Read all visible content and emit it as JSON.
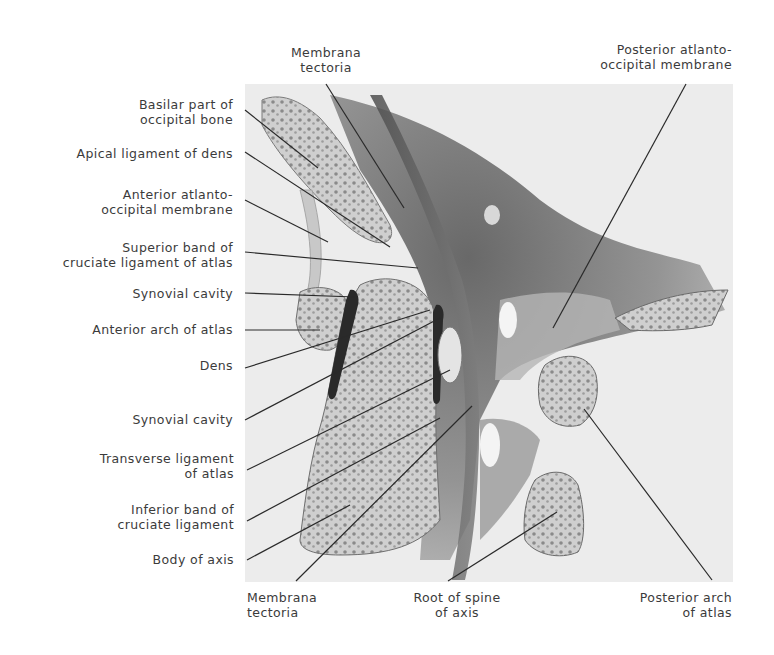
{
  "figure": {
    "labels_left": [
      {
        "id": "basilar-part",
        "lines": [
          "Basilar part of",
          "occipital bone"
        ]
      },
      {
        "id": "apical-ligament",
        "lines": [
          "Apical ligament of dens"
        ]
      },
      {
        "id": "anterior-atlanto-occipital",
        "lines": [
          "Anterior atlanto-",
          "occipital membrane"
        ]
      },
      {
        "id": "superior-band",
        "lines": [
          "Superior band of",
          "cruciate ligament of atlas"
        ]
      },
      {
        "id": "synovial-cavity-1",
        "lines": [
          "Synovial cavity"
        ]
      },
      {
        "id": "anterior-arch",
        "lines": [
          "Anterior arch of atlas"
        ]
      },
      {
        "id": "dens",
        "lines": [
          "Dens"
        ]
      },
      {
        "id": "synovial-cavity-2",
        "lines": [
          "Synovial cavity"
        ]
      },
      {
        "id": "transverse-ligament",
        "lines": [
          "Transverse ligament",
          "of atlas"
        ]
      },
      {
        "id": "inferior-band",
        "lines": [
          "Inferior band of",
          "cruciate ligament"
        ]
      },
      {
        "id": "body-of-axis",
        "lines": [
          "Body of axis"
        ]
      }
    ],
    "labels_top": [
      {
        "id": "membrana-tectoria-top",
        "lines": [
          "Membrana",
          "tectoria"
        ]
      },
      {
        "id": "posterior-atlanto-occipital",
        "lines": [
          "Posterior atlanto-",
          "occipital membrane"
        ]
      }
    ],
    "labels_bottom": [
      {
        "id": "membrana-tectoria-bottom",
        "lines": [
          "Membrana",
          "tectoria"
        ]
      },
      {
        "id": "root-of-spine",
        "lines": [
          "Root of spine",
          "of axis"
        ]
      },
      {
        "id": "posterior-arch",
        "lines": [
          "Posterior arch",
          "of atlas"
        ]
      }
    ],
    "colors": {
      "background": "#ffffff",
      "text": "#3b3b3b",
      "leader_line": "#2a2a2a",
      "illustration_bg": "#ebebeb",
      "bone_fill": "#d6d6d6",
      "soft_tissue_dark": "#6e6e6e"
    }
  }
}
